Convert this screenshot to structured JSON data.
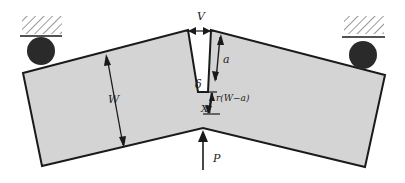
{
  "diagram": {
    "type": "three-point bend specimen with notch (SENB)",
    "labels": {
      "crack_opening": "V",
      "crack_length": "a",
      "notch_displacement": "δ",
      "ligament_rotation": "r(W−a)",
      "width": "W",
      "load": "P",
      "rotation_center": "X"
    },
    "colors": {
      "specimen_fill": "#d4d4d4",
      "outline": "#1a1a1a",
      "roller": "#2a2a2a",
      "background": "#ffffff"
    }
  }
}
